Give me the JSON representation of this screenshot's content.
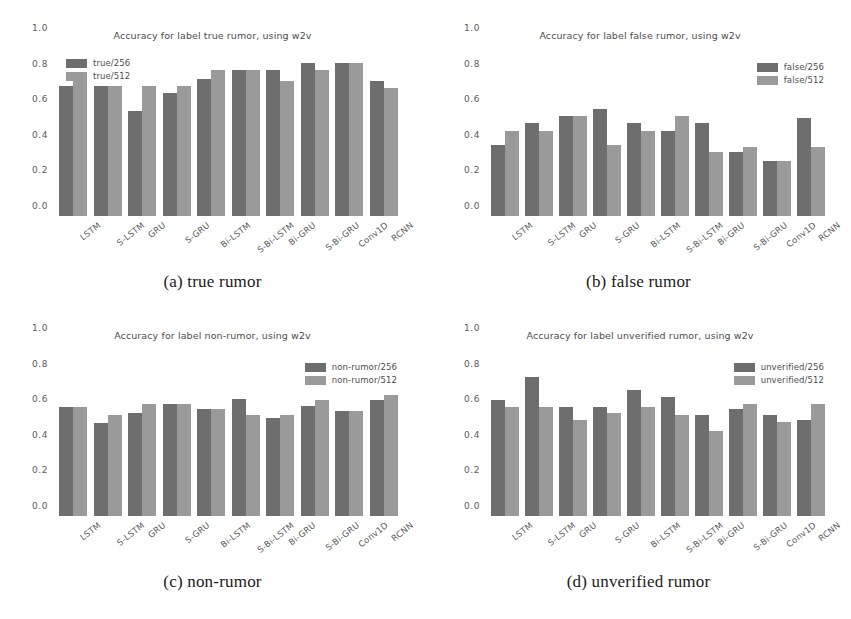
{
  "page": {
    "cropped_top_text": "",
    "background": "#ffffff",
    "colors": {
      "bar_256": "#6e6e6e",
      "bar_512": "#9a9a9a",
      "tick_text": "#5a5a5a",
      "title_text": "#4d4d4d"
    }
  },
  "figure": {
    "panels": [
      {
        "key": "a",
        "caption": "(a) true rumor"
      },
      {
        "key": "b",
        "caption": "(b) false rumor"
      },
      {
        "key": "c",
        "caption": "(c) non-rumor"
      },
      {
        "key": "d",
        "caption": "(d) unverified rumor"
      }
    ]
  },
  "chart_data": [
    {
      "type": "bar",
      "panel": "a",
      "title": "Accuracy for label true rumor, using w2v",
      "xlabel": "",
      "ylabel": "",
      "ylim": [
        0.0,
        1.0
      ],
      "yticks": [
        "0.0",
        "0.2",
        "0.4",
        "0.6",
        "0.8",
        "1.0"
      ],
      "grid": false,
      "legend_position": "upper left",
      "categories": [
        "LSTM",
        "S-LSTM",
        "GRU",
        "S-GRU",
        "Bi-LSTM",
        "S-Bi-LSTM",
        "Bi-GRU",
        "S-Bi-GRU",
        "Conv1D",
        "RCNN"
      ],
      "series": [
        {
          "name": "true/256",
          "color": "#6e6e6e",
          "values": [
            0.73,
            0.73,
            0.59,
            0.69,
            0.77,
            0.82,
            0.82,
            0.86,
            0.86,
            0.76
          ]
        },
        {
          "name": "true/512",
          "color": "#9a9a9a",
          "values": [
            0.78,
            0.73,
            0.73,
            0.73,
            0.82,
            0.82,
            0.76,
            0.82,
            0.86,
            0.72
          ]
        }
      ]
    },
    {
      "type": "bar",
      "panel": "b",
      "title": "Accuracy for label false rumor, using w2v",
      "xlabel": "",
      "ylabel": "",
      "ylim": [
        0.0,
        1.0
      ],
      "yticks": [
        "0.0",
        "0.2",
        "0.4",
        "0.6",
        "0.8",
        "1.0"
      ],
      "grid": false,
      "legend_position": "upper right",
      "categories": [
        "LSTM",
        "S-LSTM",
        "GRU",
        "S-GRU",
        "Bi-LSTM",
        "S-Bi-LSTM",
        "Bi-GRU",
        "S-Bi-GRU",
        "Conv1D",
        "RCNN"
      ],
      "series": [
        {
          "name": "false/256",
          "color": "#6e6e6e",
          "values": [
            0.4,
            0.52,
            0.56,
            0.6,
            0.52,
            0.48,
            0.52,
            0.36,
            0.31,
            0.55
          ]
        },
        {
          "name": "false/512",
          "color": "#9a9a9a",
          "values": [
            0.48,
            0.48,
            0.56,
            0.4,
            0.48,
            0.56,
            0.36,
            0.39,
            0.31,
            0.39
          ]
        }
      ]
    },
    {
      "type": "bar",
      "panel": "c",
      "title": "Accuracy for label non-rumor, using w2v",
      "xlabel": "",
      "ylabel": "",
      "ylim": [
        0.0,
        1.0
      ],
      "yticks": [
        "0.0",
        "0.2",
        "0.4",
        "0.6",
        "0.8",
        "1.0"
      ],
      "grid": false,
      "legend_position": "upper right",
      "categories": [
        "LSTM",
        "S-LSTM",
        "GRU",
        "S-GRU",
        "Bi-LSTM",
        "S-Bi-LSTM",
        "Bi-GRU",
        "S-Bi-GRU",
        "Conv1D",
        "RCNN"
      ],
      "series": [
        {
          "name": "non-rumor/256",
          "color": "#6e6e6e",
          "values": [
            0.61,
            0.52,
            0.58,
            0.63,
            0.6,
            0.66,
            0.55,
            0.62,
            0.59,
            0.65
          ]
        },
        {
          "name": "non-rumor/512",
          "color": "#9a9a9a",
          "values": [
            0.61,
            0.57,
            0.63,
            0.63,
            0.6,
            0.57,
            0.57,
            0.65,
            0.59,
            0.68
          ]
        }
      ]
    },
    {
      "type": "bar",
      "panel": "d",
      "title": "Accuracy for label unverified rumor, using w2v",
      "xlabel": "",
      "ylabel": "",
      "ylim": [
        0.0,
        1.0
      ],
      "yticks": [
        "0.0",
        "0.2",
        "0.4",
        "0.6",
        "0.8",
        "1.0"
      ],
      "grid": false,
      "legend_position": "upper right",
      "categories": [
        "LSTM",
        "S-LSTM",
        "GRU",
        "S-GRU",
        "Bi-LSTM",
        "S-Bi-LSTM",
        "Bi-GRU",
        "S-Bi-GRU",
        "Conv1D",
        "RCNN"
      ],
      "series": [
        {
          "name": "unverified/256",
          "color": "#6e6e6e",
          "values": [
            0.65,
            0.78,
            0.61,
            0.61,
            0.71,
            0.67,
            0.57,
            0.6,
            0.57,
            0.54
          ]
        },
        {
          "name": "unverified/512",
          "color": "#9a9a9a",
          "values": [
            0.61,
            0.61,
            0.54,
            0.58,
            0.61,
            0.57,
            0.48,
            0.63,
            0.53,
            0.63
          ]
        }
      ]
    }
  ]
}
